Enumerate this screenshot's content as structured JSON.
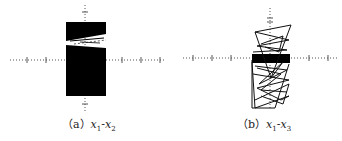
{
  "figures": [
    {
      "id": "a",
      "label": "（a）",
      "var1": "x",
      "sub1": "1",
      "sep": "-",
      "var2": "x",
      "sub2": "2",
      "description": "Phase portrait x1-x2: dense filled region with thin diagonal gap"
    },
    {
      "id": "b",
      "label": "（b）",
      "var1": "x",
      "sub1": "1",
      "sep": "-",
      "var2": "x",
      "sub2": "3",
      "description": "Phase portrait x1-x3: tangled trajectory with dense band near horizontal axis"
    }
  ],
  "colors": {
    "trajectory": "#000000",
    "axes": "#555555",
    "background": "#ffffff"
  }
}
